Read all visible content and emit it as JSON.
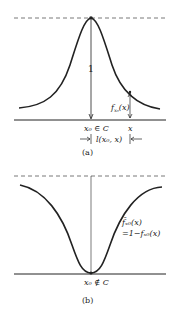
{
  "figure_a": {
    "caption": "(a)",
    "height_label": "1",
    "function_label": "f",
    "function_sub": "x₀",
    "function_arg": "(x)",
    "center_label": "x₀ ∈ C",
    "x_label": "x",
    "distance_label": "l(x₀, x)"
  },
  "figure_b": {
    "caption": "(b)",
    "function_label_line1": "f̄ₓ₀(x)",
    "function_label_line2": "=1−fₓ₀(x)",
    "center_label": "x₀ ∉ C"
  },
  "colors": {
    "ink": "#222222",
    "dash": "#555555"
  }
}
